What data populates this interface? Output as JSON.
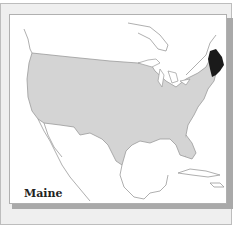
{
  "map": {
    "label": "Maine",
    "highlighted_region": "Maine",
    "region_context": "United States (contiguous)",
    "colors": {
      "highlight": "#1a1a1a",
      "country_fill": "#d4d4d4",
      "other_land": "#ffffff",
      "coastline": "#9a9a9a",
      "panel_bg": "#efefef",
      "frame_shadow": "#a9a9a9"
    }
  }
}
